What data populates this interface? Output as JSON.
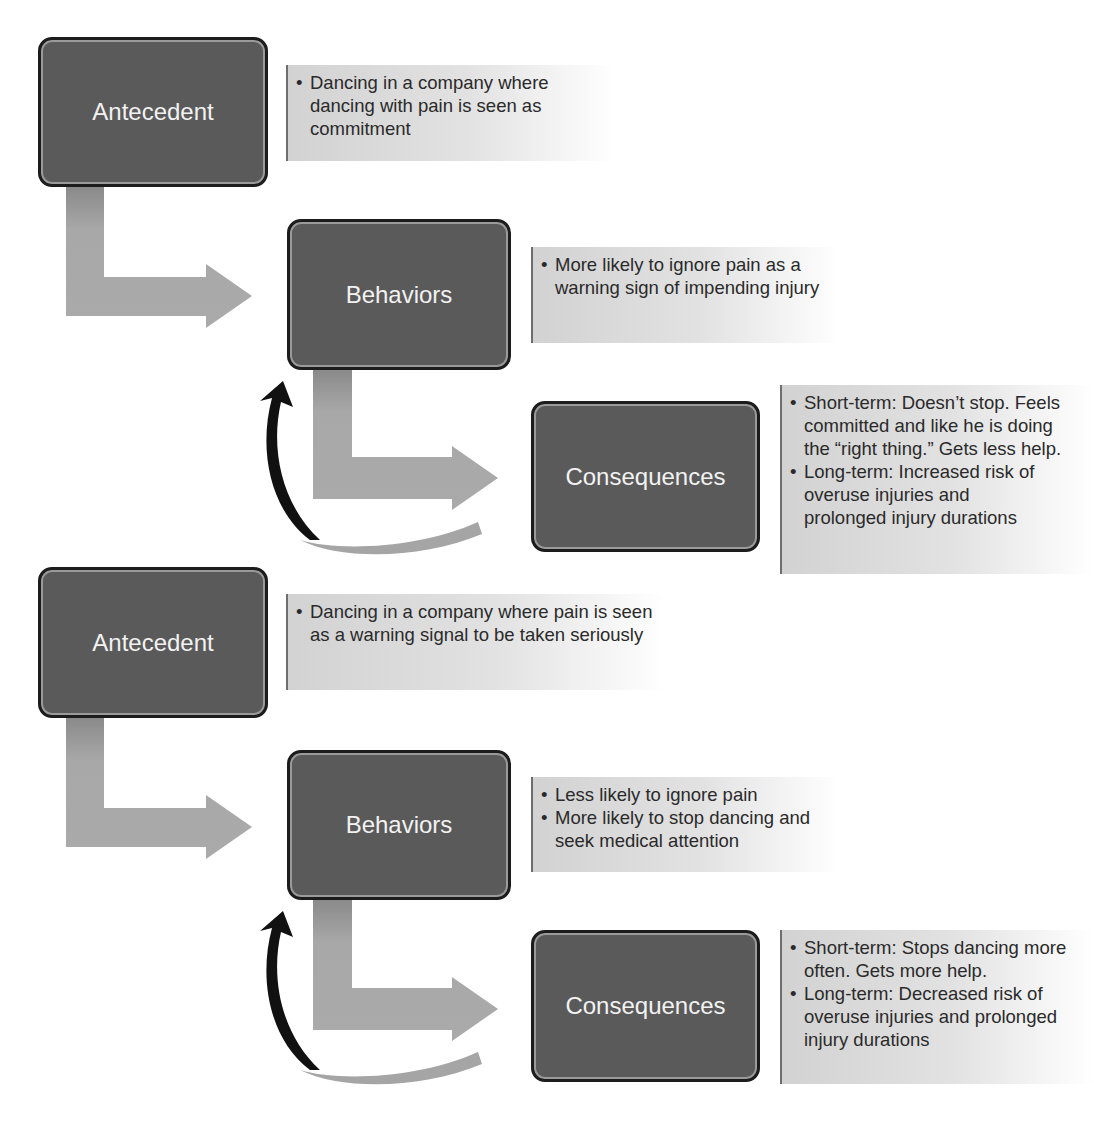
{
  "colors": {
    "box_fill": "#5a5a5a",
    "box_border": "#1c1c1c",
    "box_text": "#f2f2f2",
    "flow_arrow": "#a8a8a8",
    "feedback_arrow": "#111111",
    "note_bg": "#d8d8d8",
    "note_text": "#2a2a2a"
  },
  "scenarios": [
    {
      "antecedent": {
        "label": "Antecedent",
        "notes": [
          "Dancing in a company where dancing with pain is seen as commitment"
        ]
      },
      "behaviors": {
        "label": "Behaviors",
        "notes": [
          "More likely to ignore pain as a warning sign of impending injury"
        ]
      },
      "consequences": {
        "label": "Consequences",
        "notes": [
          "Short-term: Doesn’t stop. Feels committed and like he is doing the “right thing.” Gets less help.",
          "Long-term: Increased risk of overuse injuries and prolonged injury durations"
        ]
      }
    },
    {
      "antecedent": {
        "label": "Antecedent",
        "notes": [
          "Dancing in a company where pain is seen as a warning signal to be taken seriously"
        ]
      },
      "behaviors": {
        "label": "Behaviors",
        "notes": [
          "Less likely to ignore pain",
          "More likely to stop dancing and seek medical attention"
        ]
      },
      "consequences": {
        "label": "Consequences",
        "notes": [
          "Short-term: Stops dancing more often. Gets more help.",
          "Long-term: Decreased risk of overuse injuries and prolonged injury durations"
        ]
      }
    }
  ]
}
